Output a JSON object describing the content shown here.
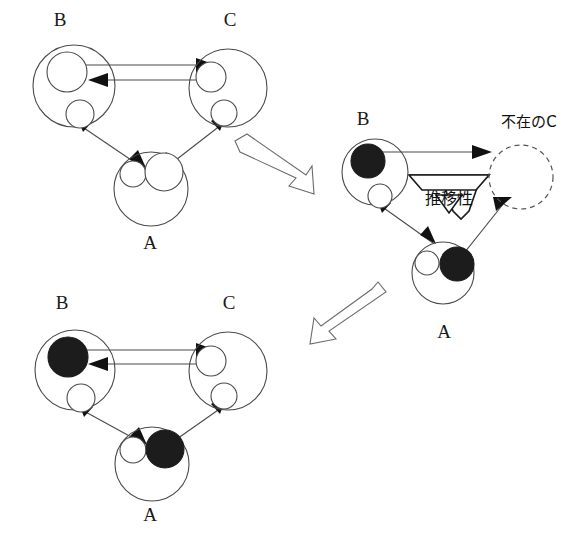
{
  "figure": {
    "type": "diagram",
    "background_color": "#ffffff",
    "stroke_color": "#4a4a4a",
    "filled_color": "#1c1c1c"
  },
  "panels": [
    {
      "id": "panel-top-left",
      "name": "initial-triad",
      "nodes": [
        {
          "id": "B",
          "label": "B",
          "label_pos": {
            "x": 60,
            "y": 22
          },
          "outer": {
            "cx": 74,
            "cy": 86,
            "r": 41
          },
          "inner": [
            {
              "cx": 67,
              "cy": 72,
              "r": 20,
              "filled": false
            },
            {
              "cx": 80,
              "cy": 114,
              "r": 14,
              "filled": false
            }
          ]
        },
        {
          "id": "C",
          "label": "C",
          "label_pos": {
            "x": 230,
            "y": 22
          },
          "outer": {
            "cx": 228,
            "cy": 88,
            "r": 39
          },
          "inner": [
            {
              "cx": 211,
              "cy": 77,
              "r": 15,
              "filled": false
            },
            {
              "cx": 224,
              "cy": 113,
              "r": 13,
              "filled": false
            }
          ]
        },
        {
          "id": "A",
          "label": "A",
          "label_pos": {
            "x": 150,
            "y": 245
          },
          "outer": {
            "cx": 151,
            "cy": 189,
            "r": 37
          },
          "inner": [
            {
              "cx": 133,
              "cy": 174,
              "r": 13,
              "filled": false
            },
            {
              "cx": 164,
              "cy": 172,
              "r": 19,
              "filled": false
            }
          ]
        }
      ]
    },
    {
      "id": "panel-middle-right",
      "name": "absent-c-transitivity",
      "annotation": "推移性",
      "absent_label": "不在のC",
      "nodes": [
        {
          "id": "B",
          "label": "B",
          "label_pos": {
            "x": 363,
            "y": 121
          },
          "outer": {
            "cx": 375,
            "cy": 172,
            "r": 33
          },
          "inner": [
            {
              "cx": 368,
              "cy": 161,
              "r": 17,
              "filled": true
            },
            {
              "cx": 380,
              "cy": 196,
              "r": 12,
              "filled": false
            }
          ]
        },
        {
          "id": "C_absent",
          "label": "不在のC",
          "label_pos": {
            "x": 529,
            "y": 122
          },
          "outer": {
            "cx": 521,
            "cy": 177,
            "r": 32
          },
          "dashed": true,
          "inner": []
        },
        {
          "id": "A",
          "label": "A",
          "label_pos": {
            "x": 444,
            "y": 334
          },
          "outer": {
            "cx": 443,
            "cy": 273,
            "r": 31
          },
          "inner": [
            {
              "cx": 427,
              "cy": 263,
              "r": 12,
              "filled": false
            },
            {
              "cx": 457,
              "cy": 264,
              "r": 17,
              "filled": true
            }
          ]
        }
      ]
    },
    {
      "id": "panel-bottom-left",
      "name": "resolved-triad",
      "nodes": [
        {
          "id": "B",
          "label": "B",
          "label_pos": {
            "x": 62,
            "y": 305
          },
          "outer": {
            "cx": 75,
            "cy": 370,
            "r": 40
          },
          "inner": [
            {
              "cx": 68,
              "cy": 357,
              "r": 20,
              "filled": true
            },
            {
              "cx": 81,
              "cy": 398,
              "r": 14,
              "filled": false
            }
          ]
        },
        {
          "id": "C",
          "label": "C",
          "label_pos": {
            "x": 229,
            "y": 305
          },
          "outer": {
            "cx": 228,
            "cy": 371,
            "r": 39
          },
          "inner": [
            {
              "cx": 211,
              "cy": 361,
              "r": 15,
              "filled": false
            },
            {
              "cx": 224,
              "cy": 396,
              "r": 13,
              "filled": false
            }
          ]
        },
        {
          "id": "A",
          "label": "A",
          "label_pos": {
            "x": 150,
            "y": 517
          },
          "outer": {
            "cx": 152,
            "cy": 464,
            "r": 37
          },
          "inner": [
            {
              "cx": 133,
              "cy": 450,
              "r": 13,
              "filled": false
            },
            {
              "cx": 165,
              "cy": 449,
              "r": 19,
              "filled": true
            }
          ]
        }
      ]
    }
  ],
  "transition_arrows": [
    {
      "id": "transition-1",
      "from": "panel-top-left",
      "to": "panel-middle-right",
      "direction": "down-right"
    },
    {
      "id": "transition-2",
      "from": "panel-middle-right",
      "to": "panel-bottom-left",
      "direction": "down-left"
    }
  ],
  "labels": {
    "transitivity": "推移性",
    "absent_c": "不在のC",
    "a": "A",
    "b": "B",
    "c": "C"
  }
}
